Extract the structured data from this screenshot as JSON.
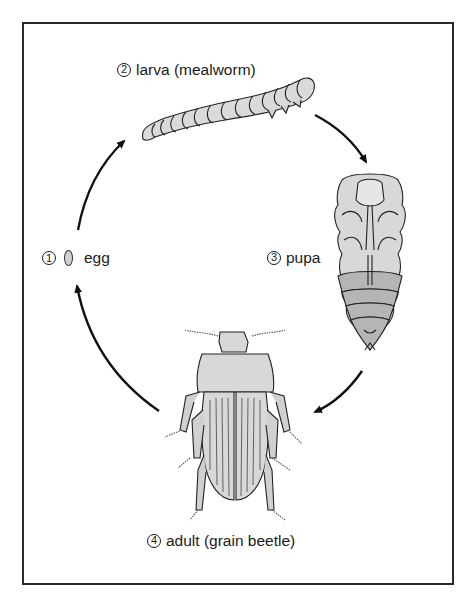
{
  "diagram": {
    "type": "life-cycle",
    "stages": [
      {
        "number": "1",
        "name": "egg",
        "label": "egg",
        "circled_number": "1"
      },
      {
        "number": "2",
        "name": "larva",
        "label": "larva (mealworm)",
        "circled_number": "2"
      },
      {
        "number": "3",
        "name": "pupa",
        "label": "pupa",
        "circled_number": "3"
      },
      {
        "number": "4",
        "name": "adult",
        "label": "adult (grain beetle)",
        "circled_number": "4"
      }
    ],
    "arrows": [
      {
        "from": "egg",
        "to": "larva"
      },
      {
        "from": "larva",
        "to": "pupa"
      },
      {
        "from": "pupa",
        "to": "adult"
      },
      {
        "from": "adult",
        "to": "egg"
      }
    ],
    "colors": {
      "border": "#2a2a2a",
      "ink": "#1a1a1a",
      "fill_light": "#d8d8d8",
      "fill_dark": "#b5b5b5",
      "background": "#ffffff"
    }
  }
}
